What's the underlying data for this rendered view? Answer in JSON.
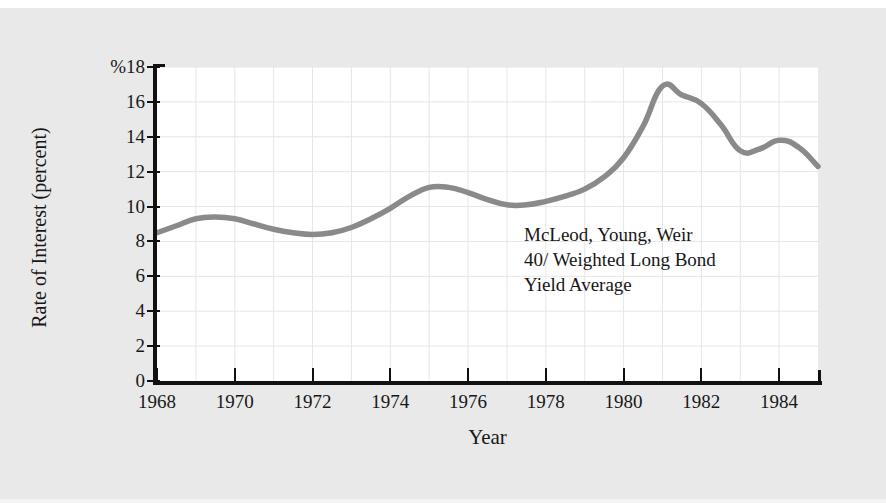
{
  "chart_data": {
    "type": "line",
    "title": "",
    "subtitle": "",
    "xlabel": "Year",
    "ylabel": "Rate of Interest (percent)",
    "y_unit_prefix": "%",
    "xlim": [
      1968,
      1985
    ],
    "ylim": [
      0,
      18
    ],
    "grid": true,
    "legend_position": "none",
    "line_color": "#8a8a8a",
    "plot_background": "#ffffff",
    "page_background": "#e9e9e9",
    "axis_color": "#111111",
    "gridline_color": "#e6e6e6",
    "x_ticks": [
      1968,
      1970,
      1972,
      1974,
      1976,
      1978,
      1980,
      1982,
      1984
    ],
    "x_tick_labels": [
      "1968",
      "1970",
      "1972",
      "1974",
      "1976",
      "1978",
      "1980",
      "1982",
      "1984"
    ],
    "x_minor_ticks": [
      1969,
      1971,
      1973,
      1975,
      1977,
      1979,
      1981,
      1983,
      1985
    ],
    "y_ticks": [
      0,
      2,
      4,
      6,
      8,
      10,
      12,
      14,
      16,
      18
    ],
    "y_tick_labels": [
      "0",
      "2",
      "4",
      "6",
      "8",
      "10",
      "12",
      "14",
      "16",
      "%18"
    ],
    "series": [
      {
        "name": "McLeod, Young, Weir 40/ Weighted Long Bond Yield Average",
        "x": [
          1968.0,
          1968.5,
          1969.0,
          1969.5,
          1970.0,
          1970.5,
          1971.0,
          1971.5,
          1972.0,
          1972.5,
          1973.0,
          1973.5,
          1974.0,
          1974.5,
          1975.0,
          1975.5,
          1976.0,
          1976.5,
          1977.0,
          1977.5,
          1978.0,
          1978.5,
          1979.0,
          1979.5,
          1980.0,
          1980.5,
          1981.0,
          1981.5,
          1982.0,
          1982.5,
          1983.0,
          1983.5,
          1984.0,
          1984.5,
          1985.0
        ],
        "y": [
          8.5,
          8.9,
          9.3,
          9.4,
          9.3,
          9.0,
          8.7,
          8.5,
          8.4,
          8.5,
          8.8,
          9.3,
          9.9,
          10.6,
          11.1,
          11.1,
          10.8,
          10.4,
          10.1,
          10.1,
          10.3,
          10.6,
          11.0,
          11.7,
          12.8,
          14.6,
          16.9,
          16.4,
          15.9,
          14.7,
          13.2,
          13.3,
          13.8,
          13.4,
          12.3
        ]
      }
    ],
    "annotation": {
      "lines": [
        "McLeod, Young, Weir",
        "40/ Weighted Long Bond",
        "Yield Average"
      ]
    }
  }
}
